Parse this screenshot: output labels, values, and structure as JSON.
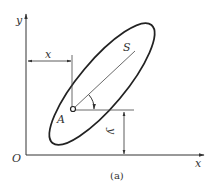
{
  "figure": {
    "caption": "(a)",
    "axes": {
      "origin_label": "O",
      "x_axis_label": "x",
      "y_axis_label": "y"
    },
    "point": {
      "label": "A"
    },
    "direction": {
      "label": "S"
    },
    "dimensions": {
      "horizontal_label": "x",
      "vertical_label": "y"
    },
    "colors": {
      "stroke": "#333333",
      "background": "#ffffff"
    }
  }
}
